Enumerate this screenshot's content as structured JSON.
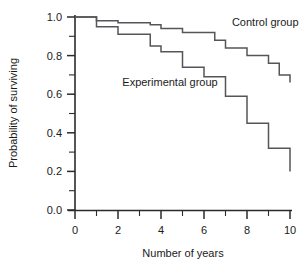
{
  "chart_data": {
    "type": "line",
    "title": "",
    "subtitle": "",
    "xlabel": "Number of years",
    "ylabel": "Probability of surviving",
    "xlim": [
      0,
      10
    ],
    "ylim": [
      0.0,
      1.0
    ],
    "grid": false,
    "legend_position": "inline-annotation",
    "x_ticks": [
      0,
      2,
      4,
      6,
      8,
      10
    ],
    "x_tick_labels": [
      "0",
      "2",
      "4",
      "6",
      "8",
      "10"
    ],
    "x_minor_ticks": [
      1,
      3,
      5,
      7,
      9
    ],
    "y_ticks": [
      0.0,
      0.2,
      0.4,
      0.6,
      0.8,
      1.0
    ],
    "y_tick_labels": [
      "0.0",
      "0.2",
      "0.4",
      "0.6",
      "0.8",
      "1.0"
    ],
    "y_minor_ticks": [
      0.1,
      0.3,
      0.5,
      0.7,
      0.9
    ],
    "style": "step-post",
    "line_color": "#55565a",
    "axis_color": "#2b2b2b",
    "series": [
      {
        "name": "Control group",
        "label": "Control group",
        "label_x": 7.3,
        "label_y": 0.955,
        "x": [
          0,
          1,
          2,
          3,
          3.5,
          4,
          5,
          6,
          6.5,
          7,
          8,
          9,
          9.5,
          10
        ],
        "values": [
          1.0,
          0.98,
          0.97,
          0.97,
          0.96,
          0.94,
          0.92,
          0.92,
          0.88,
          0.84,
          0.8,
          0.76,
          0.7,
          0.66
        ]
      },
      {
        "name": "Experimental group",
        "label": "Experimental group",
        "label_x": 2.2,
        "label_y": 0.645,
        "x": [
          0,
          1,
          2,
          3,
          3.5,
          4,
          5,
          6,
          7,
          8,
          9,
          10
        ],
        "values": [
          1.0,
          0.95,
          0.91,
          0.91,
          0.85,
          0.82,
          0.74,
          0.69,
          0.59,
          0.45,
          0.32,
          0.2
        ]
      }
    ]
  },
  "figure": {
    "y_axis_title": "Probability of surviving",
    "x_axis_title": "Number of years",
    "series_label_control": "Control group",
    "series_label_experimental": "Experimental group",
    "ytick_0": "0.0",
    "ytick_1": "0.2",
    "ytick_2": "0.4",
    "ytick_3": "0.6",
    "ytick_4": "0.8",
    "ytick_5": "1.0",
    "xtick_0": "0",
    "xtick_1": "2",
    "xtick_2": "4",
    "xtick_3": "6",
    "xtick_4": "8",
    "xtick_5": "10"
  }
}
